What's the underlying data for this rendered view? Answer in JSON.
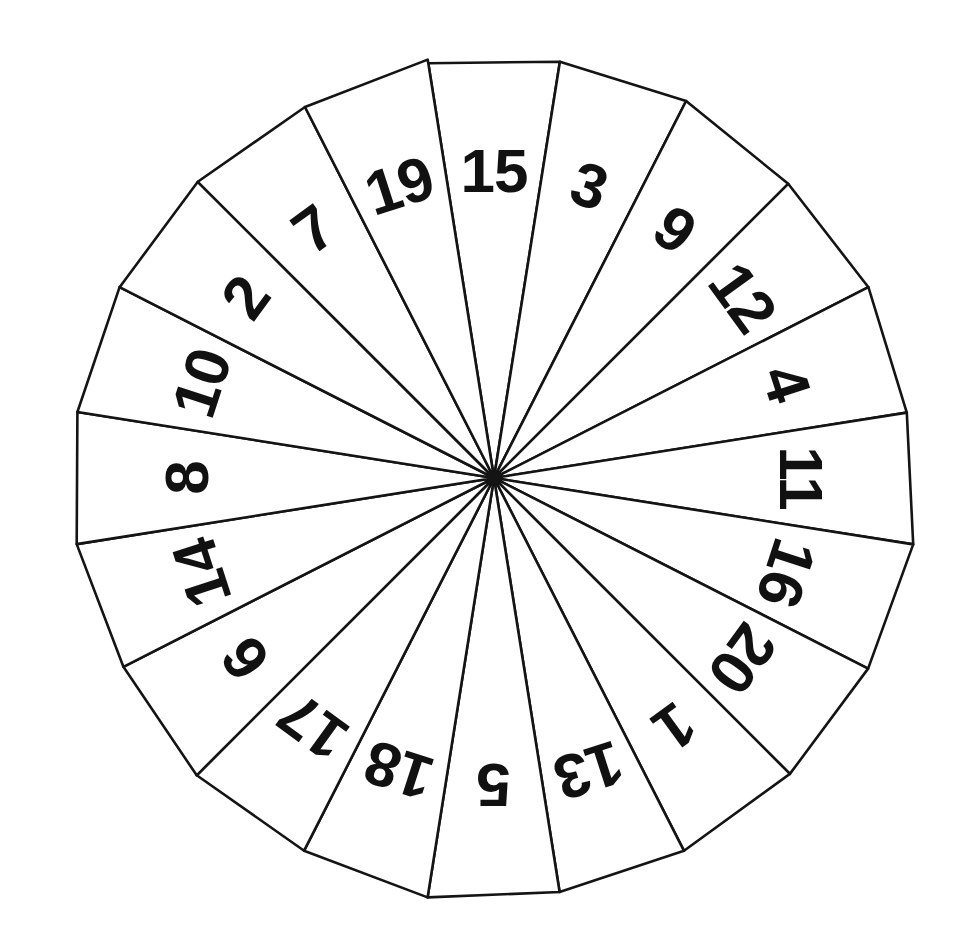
{
  "figure": {
    "kind": "spinner-wheel",
    "background_color": "#ffffff",
    "line_color": "#141414",
    "label_color": "#111111",
    "center_x": 494,
    "center_y": 478,
    "radius": 420,
    "sector_count": 20,
    "start_angle_deg": -99,
    "sector_span_deg": 18
  },
  "chart_data": {
    "type": "pie",
    "xlabel": "",
    "ylabel": "",
    "legend_position": "none",
    "grid": false,
    "categories": [
      "15",
      "3",
      "9",
      "12",
      "4",
      "11",
      "16",
      "20",
      "1",
      "13",
      "5",
      "18",
      "17",
      "6",
      "14",
      "8",
      "10",
      "2",
      "7",
      "19"
    ],
    "values": [
      5,
      5,
      5,
      5,
      5,
      5,
      5,
      5,
      5,
      5,
      5,
      5,
      5,
      5,
      5,
      5,
      5,
      5,
      5,
      5
    ],
    "value_unit": "percent",
    "note": "All twenty sectors are equal in size (18 degrees / 5 percent each).",
    "order": "clockwise from top",
    "sectors": [
      {
        "label": "15",
        "index": 0,
        "mid_angle_deg": -90,
        "share_pct": 5
      },
      {
        "label": "3",
        "index": 1,
        "mid_angle_deg": -72,
        "share_pct": 5
      },
      {
        "label": "9",
        "index": 2,
        "mid_angle_deg": -54,
        "share_pct": 5
      },
      {
        "label": "12",
        "index": 3,
        "mid_angle_deg": -36,
        "share_pct": 5
      },
      {
        "label": "4",
        "index": 4,
        "mid_angle_deg": -18,
        "share_pct": 5
      },
      {
        "label": "11",
        "index": 5,
        "mid_angle_deg": 0,
        "share_pct": 5
      },
      {
        "label": "16",
        "index": 6,
        "mid_angle_deg": 18,
        "share_pct": 5
      },
      {
        "label": "20",
        "index": 7,
        "mid_angle_deg": 36,
        "share_pct": 5
      },
      {
        "label": "1",
        "index": 8,
        "mid_angle_deg": 54,
        "share_pct": 5
      },
      {
        "label": "13",
        "index": 9,
        "mid_angle_deg": 72,
        "share_pct": 5
      },
      {
        "label": "5",
        "index": 10,
        "mid_angle_deg": 90,
        "share_pct": 5
      },
      {
        "label": "18",
        "index": 11,
        "mid_angle_deg": 108,
        "share_pct": 5
      },
      {
        "label": "17",
        "index": 12,
        "mid_angle_deg": 126,
        "share_pct": 5
      },
      {
        "label": "6",
        "index": 13,
        "mid_angle_deg": 144,
        "share_pct": 5
      },
      {
        "label": "14",
        "index": 14,
        "mid_angle_deg": 162,
        "share_pct": 5
      },
      {
        "label": "8",
        "index": 15,
        "mid_angle_deg": 180,
        "share_pct": 5
      },
      {
        "label": "10",
        "index": 16,
        "mid_angle_deg": 198,
        "share_pct": 5
      },
      {
        "label": "2",
        "index": 17,
        "mid_angle_deg": 216,
        "share_pct": 5
      },
      {
        "label": "7",
        "index": 18,
        "mid_angle_deg": 234,
        "share_pct": 5
      },
      {
        "label": "19",
        "index": 19,
        "mid_angle_deg": 252,
        "share_pct": 5
      }
    ]
  }
}
